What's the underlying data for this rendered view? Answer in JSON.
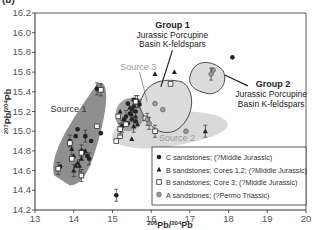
{
  "panel_label": "(b)",
  "chart_data": {
    "type": "scatter",
    "title": "",
    "xlabel": "206Pb/204Pb",
    "ylabel": "207Pb/204Pb",
    "xlim": [
      13,
      20
    ],
    "ylim": [
      14.2,
      16.2
    ],
    "xticks": [
      13,
      14,
      15,
      16,
      17,
      18,
      19,
      20
    ],
    "yticks": [
      14.2,
      14.4,
      14.6,
      14.8,
      15.0,
      15.2,
      15.4,
      15.6,
      15.8,
      16.0,
      16.2
    ],
    "grid": false,
    "legend_position": "lower right",
    "legend": [
      {
        "label": "C sandstones; (?Middle Jurassic)",
        "marker": "filled-circle"
      },
      {
        "label": "B sandstones; Cores 1,2; (?Middle Jurassic)",
        "marker": "filled-triangle"
      },
      {
        "label": "B sandstones; Core 3; (?Middle Jurassic)",
        "marker": "open-square"
      },
      {
        "label": "A sandstones; (?Permo Triassic)",
        "marker": "grey-circle"
      }
    ],
    "fields": [
      {
        "name": "Source 1",
        "color": "#8f8f8f"
      },
      {
        "name": "Source 2",
        "color": "#d9d9d9"
      },
      {
        "name": "Source 3",
        "color": "#a0a0a0"
      },
      {
        "name": "Group 1",
        "color": "#dcdcdc"
      },
      {
        "name": "Group 2",
        "color": "#dcdcdc"
      }
    ],
    "annotations": [
      {
        "title": "Group 1",
        "text": [
          "Jurassic Porcupine",
          "Basin K-feldspars"
        ]
      },
      {
        "title": "Group 2",
        "text": [
          "Jurassic Porcupine",
          "Basin K-feldspars"
        ]
      },
      {
        "title": "Source 1"
      },
      {
        "title": "Source 2"
      },
      {
        "title": "Source 3"
      }
    ],
    "series": [
      {
        "name": "C sandstones",
        "points": [
          [
            14.6,
            15.43
          ],
          [
            13.6,
            14.62
          ],
          [
            13.65,
            14.64
          ],
          [
            13.9,
            14.9
          ],
          [
            14.05,
            14.95
          ],
          [
            14.1,
            15.02
          ],
          [
            14.3,
            14.95
          ],
          [
            14.45,
            14.9
          ],
          [
            14.7,
            14.98
          ],
          [
            14.2,
            14.8
          ],
          [
            14.25,
            14.78
          ],
          [
            14.35,
            14.75
          ],
          [
            14.4,
            14.72
          ],
          [
            15.4,
            15.28
          ],
          [
            15.5,
            15.22
          ],
          [
            15.55,
            15.25
          ],
          [
            15.6,
            15.2
          ],
          [
            15.45,
            15.18
          ],
          [
            15.35,
            15.15
          ],
          [
            15.5,
            15.12
          ],
          [
            15.6,
            15.1
          ],
          [
            15.65,
            15.3
          ],
          [
            15.7,
            15.27
          ],
          [
            15.55,
            15.32
          ],
          [
            15.25,
            15.05
          ],
          [
            15.3,
            15.12
          ],
          [
            15.4,
            15.08
          ],
          [
            15.1,
            14.35
          ],
          [
            18.1,
            15.75
          ]
        ]
      },
      {
        "name": "B sandstones Cores 1,2",
        "points": [
          [
            13.95,
            14.82
          ],
          [
            14.0,
            14.75
          ],
          [
            14.1,
            14.68
          ],
          [
            14.15,
            14.65
          ],
          [
            14.2,
            14.72
          ],
          [
            14.3,
            14.8
          ],
          [
            14.0,
            14.6
          ],
          [
            14.05,
            14.65
          ],
          [
            15.45,
            15.24
          ],
          [
            15.5,
            15.17
          ],
          [
            15.2,
            15.2
          ],
          [
            15.6,
            15.15
          ],
          [
            15.55,
            15.05
          ],
          [
            15.65,
            15.07
          ],
          [
            16.1,
            15.58
          ],
          [
            17.4,
            15.0
          ],
          [
            15.5,
            14.92
          ],
          [
            16.6,
            15.6
          ]
        ]
      },
      {
        "name": "B sandstones Core 3",
        "points": [
          [
            13.6,
            14.62
          ],
          [
            13.9,
            14.88
          ],
          [
            13.95,
            14.72
          ],
          [
            14.2,
            14.55
          ],
          [
            14.2,
            14.78
          ],
          [
            14.6,
            15.05
          ],
          [
            14.7,
            15.42
          ],
          [
            15.1,
            14.9
          ],
          [
            15.2,
            14.95
          ],
          [
            15.2,
            15.02
          ],
          [
            15.15,
            15.15
          ],
          [
            15.35,
            15.07
          ],
          [
            15.6,
            15.3
          ],
          [
            15.85,
            15.13
          ],
          [
            16.5,
            15.48
          ],
          [
            16.1,
            15.0
          ]
        ]
      },
      {
        "name": "A sandstones",
        "points": [
          [
            15.9,
            15.12
          ],
          [
            16.1,
            15.28
          ],
          [
            16.3,
            15.22
          ],
          [
            15.95,
            15.08
          ],
          [
            16.9,
            15.0
          ],
          [
            17.6,
            15.62
          ],
          [
            17.55,
            15.58
          ]
        ]
      }
    ]
  }
}
